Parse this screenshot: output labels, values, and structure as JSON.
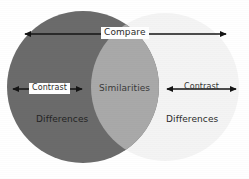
{
  "diagram": {
    "type": "venn",
    "background_color": "#ffffff",
    "circles": [
      {
        "id": "left",
        "name": "left-circle",
        "label": "Differences",
        "fill": "#6b6b6b",
        "cx": 83,
        "cy": 87,
        "r": 76
      },
      {
        "id": "right",
        "name": "right-circle",
        "label": "Differences",
        "fill": "#f4f4f4",
        "cx": 165,
        "cy": 87,
        "r": 74
      }
    ],
    "overlap": {
      "label": "Similarities",
      "fill": "#a9a9a9"
    },
    "arrows": [
      {
        "id": "compare",
        "label": "Compare",
        "label_boxed": true,
        "x1": 25,
        "x2": 226,
        "y": 34,
        "color": "#1a1a1a"
      },
      {
        "id": "contrast-left",
        "label": "Contrast",
        "label_boxed": true,
        "x1": 13,
        "x2": 82,
        "y": 89,
        "color": "#141414"
      },
      {
        "id": "contrast-right",
        "label": "Contrast",
        "label_boxed": false,
        "x1": 167,
        "x2": 236,
        "y": 89,
        "color": "#141414"
      }
    ],
    "labels": {
      "compare": "Compare",
      "contrast_left": "Contrast",
      "contrast_right": "Contrast",
      "similarities": "Similarities",
      "differences_left": "Differences",
      "differences_right": "Differences"
    },
    "colors": {
      "left_circle": "#6b6b6b",
      "right_circle": "#f4f4f4",
      "overlap": "#a9a9a9",
      "arrow": "#141414",
      "text": "#2b2b2b",
      "background": "#ffffff"
    }
  }
}
